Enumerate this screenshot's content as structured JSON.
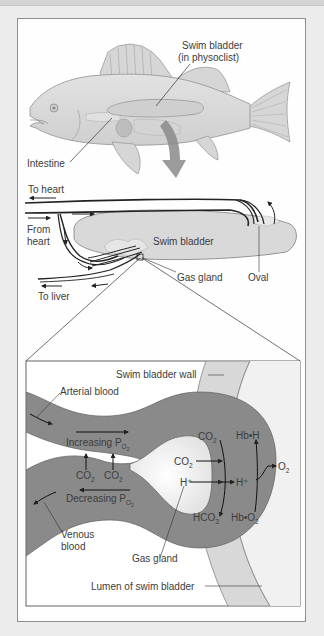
{
  "fish_view": {
    "labels": {
      "swim_bladder_line1": "Swim bladder",
      "swim_bladder_line2": "(in physoclist)",
      "intestine": "Intestine"
    }
  },
  "circulation_view": {
    "labels": {
      "to_heart": "To heart",
      "from_heart_line1": "From",
      "from_heart_line2": "heart",
      "swim_bladder": "Swim bladder",
      "gas_gland": "Gas gland",
      "oval": "Oval",
      "to_liver": "To liver"
    }
  },
  "detail_view": {
    "labels": {
      "swim_bladder_wall": "Swim bladder wall",
      "arterial_blood": "Arterial blood",
      "increasing_po2": "Increasing P",
      "decreasing_po2": "Decreasing P",
      "po2_sub_o": "O",
      "po2_sub_2": "2",
      "co2_left_a": "CO",
      "co2_left_b": "CO",
      "co2_top": "CO",
      "co2_gland": "CO",
      "h_plus_gland": "H⁺",
      "h_plus_blood": "H⁺",
      "hb_h": "Hb•H",
      "o2_out": "O",
      "hco3": "HCO",
      "hco3_sub": "3",
      "hco3_sup": "–",
      "hb_o2": "Hb•O",
      "sub_2": "2",
      "venous_blood_line1": "Venous",
      "venous_blood_line2": "blood",
      "gas_gland": "Gas gland",
      "lumen": "Lumen of swim bladder"
    }
  },
  "colors": {
    "background": "#ececec",
    "panel": "#fefefe",
    "blood_vessel": "#8a8a8a",
    "wall_band": "#d6d6d6",
    "gland_white": "#f4f4f4",
    "line": "#2a2a2a",
    "fish_body": "#d9d9d9",
    "arrow_gray": "#7a7a7a"
  }
}
